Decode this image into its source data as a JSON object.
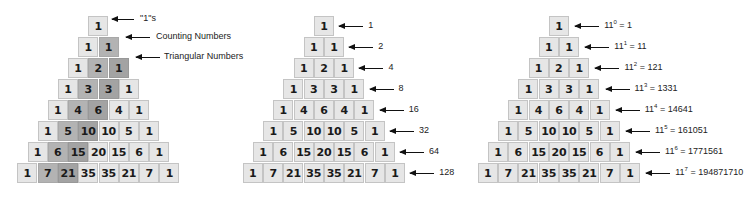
{
  "figure": {
    "rows": [
      [
        1
      ],
      [
        1,
        1
      ],
      [
        1,
        2,
        1
      ],
      [
        1,
        3,
        3,
        1
      ],
      [
        1,
        4,
        6,
        4,
        1
      ],
      [
        1,
        5,
        10,
        10,
        5,
        1
      ],
      [
        1,
        6,
        15,
        20,
        15,
        6,
        1
      ],
      [
        1,
        7,
        21,
        35,
        35,
        21,
        7,
        1
      ]
    ],
    "colors": {
      "cell_light": "#e6e6e6",
      "cell_border": "#c4c4c4",
      "counting_diagonal": "#b3b3b3",
      "triangular_diagonal": "#a3a3a3",
      "text": "#1a1a1a"
    }
  },
  "panels": [
    {
      "name": "diagonals",
      "labels": [
        "\"1\"s",
        "Counting Numbers",
        "Triangular Numbers"
      ]
    },
    {
      "name": "row-sums",
      "labels": [
        "1",
        "2",
        "4",
        "8",
        "16",
        "32",
        "64",
        "128"
      ]
    },
    {
      "name": "powers-of-eleven",
      "labels": [
        {
          "base": "11",
          "exp": "0",
          "value": "1"
        },
        {
          "base": "11",
          "exp": "1",
          "value": "11"
        },
        {
          "base": "11",
          "exp": "2",
          "value": "121"
        },
        {
          "base": "11",
          "exp": "3",
          "value": "1331"
        },
        {
          "base": "11",
          "exp": "4",
          "value": "14641"
        },
        {
          "base": "11",
          "exp": "5",
          "value": "161051"
        },
        {
          "base": "11",
          "exp": "6",
          "value": "1771561"
        },
        {
          "base": "11",
          "exp": "7",
          "value": "194871710"
        }
      ]
    }
  ]
}
